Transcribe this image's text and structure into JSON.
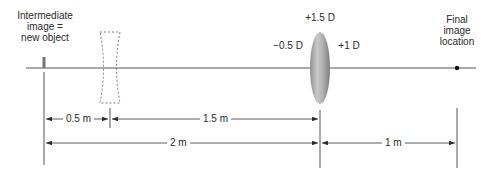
{
  "labels": {
    "intermediate_image": [
      "Intermediate",
      "image =",
      "new object"
    ],
    "total_power": "+1.5 D",
    "diverging_lens_power": "−0.5 D",
    "converging_lens_power": "+1 D",
    "final_image": [
      "Final",
      "image",
      "location"
    ]
  },
  "dimensions": {
    "object_to_diverging": "0.5 m",
    "diverging_to_lens": "1.5 m",
    "object_to_lens": "2 m",
    "lens_to_image": "1 m"
  },
  "colors": {
    "line": "#4a4a4a",
    "lens_light": "#e0e0e0",
    "lens_dark": "#8c8c8c",
    "dash": "#7a7a7a"
  }
}
